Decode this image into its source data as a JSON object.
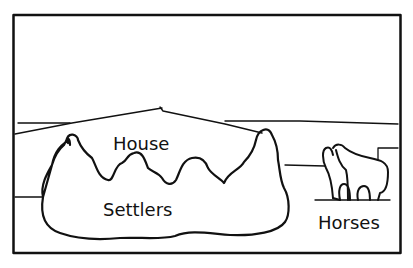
{
  "diagram": {
    "type": "sketch-scene",
    "labels": {
      "house": "House",
      "settlers": "Settlers",
      "horses": "Horses"
    },
    "colors": {
      "background": "#ffffff",
      "ink": "#111111"
    }
  }
}
